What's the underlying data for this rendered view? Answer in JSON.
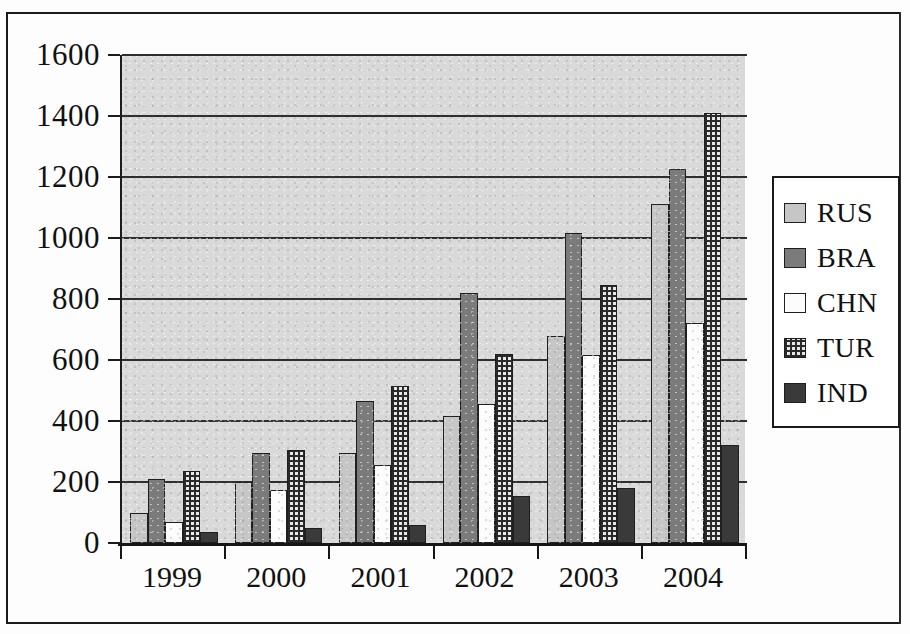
{
  "chart_data": {
    "type": "bar",
    "title": "",
    "subtitle": "",
    "xlabel": "",
    "ylabel": "",
    "categories": [
      "1999",
      "2000",
      "2001",
      "2002",
      "2003",
      "2004"
    ],
    "ylim": [
      0,
      1600
    ],
    "yticks": [
      0,
      200,
      400,
      600,
      800,
      1000,
      1200,
      1400,
      1600
    ],
    "ytick_labels": [
      "0",
      "200",
      "400",
      "600",
      "800",
      "1000",
      "1200",
      "1400",
      "1600"
    ],
    "grid": true,
    "legend_position": "right",
    "series": [
      {
        "name": "RUS",
        "color": "#c6c6c6",
        "values": [
          100,
          200,
          295,
          415,
          680,
          1110
        ]
      },
      {
        "name": "BRA",
        "color": "#7b7b7b",
        "values": [
          210,
          295,
          465,
          820,
          1015,
          1225
        ]
      },
      {
        "name": "CHN",
        "color": "#fcfcfc",
        "values": [
          70,
          175,
          255,
          455,
          615,
          720
        ]
      },
      {
        "name": "TUR",
        "color": "#e8e8e8",
        "values": [
          235,
          305,
          515,
          620,
          845,
          1410
        ]
      },
      {
        "name": "IND",
        "color": "#3a3a3a",
        "values": [
          35,
          50,
          60,
          155,
          180,
          320
        ]
      }
    ]
  },
  "legend": {
    "entries": [
      {
        "label": "RUS",
        "swatch": "light-gray-swatch"
      },
      {
        "label": "BRA",
        "swatch": "medium-gray-swatch"
      },
      {
        "label": "CHN",
        "swatch": "white-swatch"
      },
      {
        "label": "TUR",
        "swatch": "checkered-swatch"
      },
      {
        "label": "IND",
        "swatch": "dark-gray-swatch"
      }
    ]
  }
}
